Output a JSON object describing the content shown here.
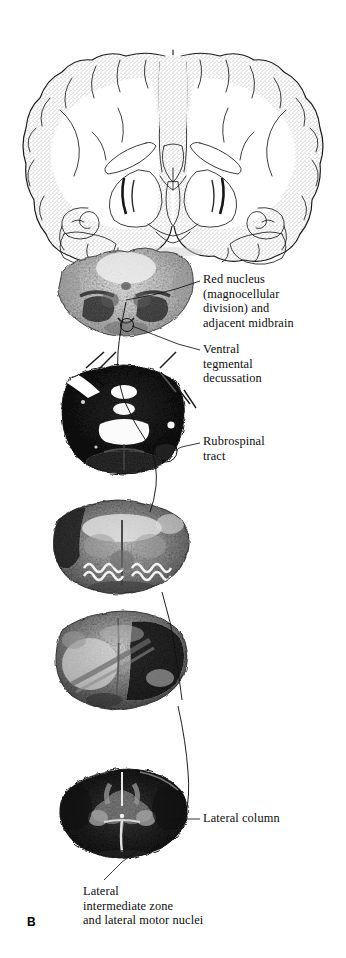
{
  "figure": {
    "panel_letter": "B"
  },
  "labels": {
    "red_nucleus": "Red nucleus\n(magnocellular\ndivision) and\nadjacent midbrain",
    "ventral_tegmental": "Ventral\ntegmental\ndecussation",
    "rubrospinal": "Rubrospinal\ntract",
    "lateral_column": "Lateral column",
    "lateral_intermediate": "Lateral\nintermediate zone\nand lateral motor nuclei"
  },
  "sections": [
    {
      "name": "coronal-forebrain-drawing",
      "style": "line-drawing-stippled"
    },
    {
      "name": "midbrain-photomicrograph",
      "style": "light-myelin-stain"
    },
    {
      "name": "pons-photomicrograph",
      "style": "dark-myelin-stain"
    },
    {
      "name": "medulla-photomicrograph",
      "style": "mid-myelin-stain"
    },
    {
      "name": "caudal-medulla-photomicrograph",
      "style": "dark-myelin-stain"
    },
    {
      "name": "spinal-cord-photomicrograph",
      "style": "dark-myelin-stain"
    }
  ],
  "colors": {
    "background": "#ffffff",
    "ink": "#111111",
    "stipple": "#5a5a5a"
  }
}
